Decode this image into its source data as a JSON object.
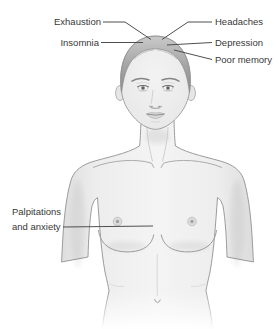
{
  "diagram": {
    "labels": [
      {
        "id": "exhaustion",
        "text": "Exhaustion",
        "points_to": "head"
      },
      {
        "id": "insomnia",
        "text": "Insomnia",
        "points_to": "head"
      },
      {
        "id": "headaches",
        "text": "Headaches",
        "points_to": "head"
      },
      {
        "id": "depression",
        "text": "Depression",
        "points_to": "head"
      },
      {
        "id": "poor-memory",
        "text": "Poor memory",
        "points_to": "head"
      },
      {
        "id": "palpitations-anxiety",
        "text": "Palpitations and anxiety",
        "points_to": "chest"
      }
    ]
  },
  "colors": {
    "background": "#ffffff",
    "label_text": "#383838",
    "leader_line": "#4f4f4f",
    "body_outline": "#919191",
    "skin_light": "#f4f4f4",
    "skin_shade": "#dcdcdc",
    "hair": "#9a9a9a"
  }
}
